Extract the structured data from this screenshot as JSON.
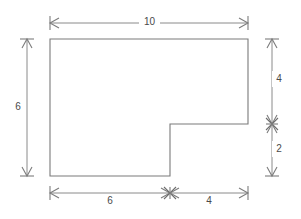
{
  "diagram": {
    "type": "dimensioned-polygon",
    "shape_name": "l-shape-polygon",
    "stroke_color": "#7a7a7a",
    "dimension_color": "#8a8a8a",
    "label_color": "#4a4a4a",
    "background_color": "#ffffff",
    "units": "",
    "dimensions": {
      "top": {
        "label": "10",
        "name": "top-width-dimension",
        "orientation": "horizontal",
        "value": 10
      },
      "left": {
        "label": "6",
        "name": "left-height-dimension",
        "orientation": "vertical",
        "value": 6
      },
      "right_upper": {
        "label": "4",
        "name": "right-upper-height-dimension",
        "orientation": "vertical",
        "value": 4
      },
      "right_lower": {
        "label": "2",
        "name": "right-lower-height-dimension",
        "orientation": "vertical",
        "value": 2
      },
      "bottom_left": {
        "label": "6",
        "name": "bottom-left-width-dimension",
        "orientation": "horizontal",
        "value": 6
      },
      "bottom_right": {
        "label": "4",
        "name": "bottom-right-width-dimension",
        "orientation": "horizontal",
        "value": 4
      }
    },
    "vertices": [
      {
        "x": 50,
        "y": 39
      },
      {
        "x": 248,
        "y": 39
      },
      {
        "x": 248,
        "y": 124
      },
      {
        "x": 170,
        "y": 124
      },
      {
        "x": 170,
        "y": 176
      },
      {
        "x": 50,
        "y": 176
      }
    ]
  }
}
